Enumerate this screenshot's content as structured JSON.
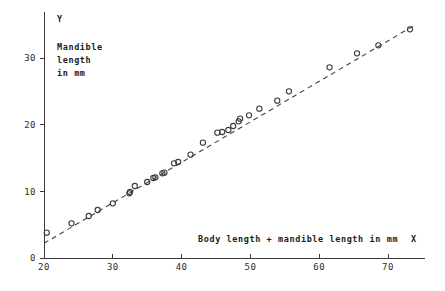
{
  "chart_data": {
    "type": "scatter",
    "title": "",
    "xlabel": "Body length + mandible length in mm",
    "ylabel": "Mandible length in mm",
    "x_axis_symbol": "X",
    "y_axis_symbol": "Y",
    "ylabel_lines": [
      "Mandible",
      "length",
      "in mm"
    ],
    "xlim": [
      20,
      74
    ],
    "ylim": [
      0,
      35
    ],
    "xticks": [
      20,
      30,
      40,
      50,
      60,
      70
    ],
    "yticks": [
      0,
      10,
      20,
      30
    ],
    "xtick_labels": [
      "20",
      "30",
      "40",
      "50",
      "60",
      "70"
    ],
    "ytick_labels": [
      "0",
      "10",
      "20",
      "30"
    ],
    "grid": false,
    "legend": false,
    "marker": "open-circle",
    "series": [
      {
        "name": "observations",
        "points": [
          [
            20.4,
            3.8
          ],
          [
            24.0,
            5.2
          ],
          [
            26.5,
            6.3
          ],
          [
            27.8,
            7.2
          ],
          [
            30.0,
            8.2
          ],
          [
            32.4,
            9.7
          ],
          [
            32.5,
            9.9
          ],
          [
            33.2,
            10.8
          ],
          [
            35.0,
            11.4
          ],
          [
            35.9,
            12.0
          ],
          [
            36.2,
            12.1
          ],
          [
            37.2,
            12.7
          ],
          [
            37.5,
            12.8
          ],
          [
            38.9,
            14.2
          ],
          [
            39.5,
            14.4
          ],
          [
            41.3,
            15.5
          ],
          [
            43.1,
            17.3
          ],
          [
            45.2,
            18.8
          ],
          [
            45.9,
            18.9
          ],
          [
            46.8,
            19.2
          ],
          [
            47.5,
            19.8
          ],
          [
            48.3,
            20.5
          ],
          [
            48.5,
            20.9
          ],
          [
            49.8,
            21.4
          ],
          [
            51.3,
            22.4
          ],
          [
            53.9,
            23.6
          ],
          [
            55.6,
            25.0
          ],
          [
            61.5,
            28.6
          ],
          [
            65.5,
            30.7
          ],
          [
            68.6,
            31.9
          ],
          [
            73.2,
            34.3
          ]
        ]
      }
    ],
    "trend_line": {
      "name": "fitted-line",
      "style": "dashed",
      "x_start": 20.0,
      "y_start": 2.2,
      "x_end": 74.0,
      "y_end": 35.0
    },
    "colors": {
      "axis": "#3a3a3a",
      "marker": "#3b3b3b",
      "line": "#444444",
      "text": "#1c1c1c",
      "background": "#ffffff"
    }
  }
}
